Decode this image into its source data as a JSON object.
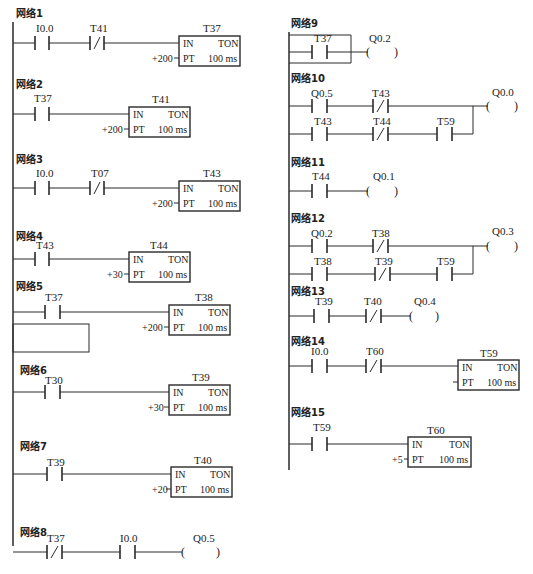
{
  "diagram": {
    "type": "PLC ladder diagram",
    "networks": [
      {
        "id": "n1",
        "label": "网络1",
        "rungs": [
          {
            "contacts": [
              {
                "name": "I0.0",
                "type": "NO"
              },
              {
                "name": "T41",
                "type": "NC"
              }
            ],
            "output": {
              "kind": "timer",
              "name": "T37",
              "type": "TON",
              "in": "IN",
              "pt_label": "PT",
              "preset": "+200",
              "base": "100 ms"
            }
          }
        ]
      },
      {
        "id": "n2",
        "label": "网络2",
        "rungs": [
          {
            "contacts": [
              {
                "name": "T37",
                "type": "NO"
              }
            ],
            "output": {
              "kind": "timer",
              "name": "T41",
              "type": "TON",
              "in": "IN",
              "pt_label": "PT",
              "preset": "+200",
              "base": "100 ms"
            }
          }
        ]
      },
      {
        "id": "n3",
        "label": "网络3",
        "rungs": [
          {
            "contacts": [
              {
                "name": "I0.0",
                "type": "NO"
              },
              {
                "name": "T07",
                "type": "NC"
              }
            ],
            "output": {
              "kind": "timer",
              "name": "T43",
              "type": "TON",
              "in": "IN",
              "pt_label": "PT",
              "preset": "+200",
              "base": "100 ms"
            }
          }
        ]
      },
      {
        "id": "n4",
        "label": "网络4",
        "rungs": [
          {
            "contacts": [
              {
                "name": "T43",
                "type": "NO"
              }
            ],
            "output": {
              "kind": "timer",
              "name": "T44",
              "type": "TON",
              "in": "IN",
              "pt_label": "PT",
              "preset": "+30",
              "base": "100 ms"
            }
          }
        ]
      },
      {
        "id": "n5",
        "label": "网络5",
        "rungs": [
          {
            "contacts": [
              {
                "name": "T37",
                "type": "NO"
              }
            ],
            "output": {
              "kind": "timer",
              "name": "T38",
              "type": "TON",
              "in": "IN",
              "pt_label": "PT",
              "preset": "+200",
              "base": "100 ms"
            }
          }
        ],
        "note": "empty parallel branch below contact"
      },
      {
        "id": "n6",
        "label": "网络6",
        "rungs": [
          {
            "contacts": [
              {
                "name": "T30",
                "type": "NO"
              }
            ],
            "output": {
              "kind": "timer",
              "name": "T39",
              "type": "TON",
              "in": "IN",
              "pt_label": "PT",
              "preset": "+30",
              "base": "100 ms"
            }
          }
        ]
      },
      {
        "id": "n7",
        "label": "网络7",
        "rungs": [
          {
            "contacts": [
              {
                "name": "T39",
                "type": "NO"
              }
            ],
            "output": {
              "kind": "timer",
              "name": "T40",
              "type": "TON",
              "in": "IN",
              "pt_label": "PT",
              "preset": "+20",
              "base": "100 ms"
            }
          }
        ]
      },
      {
        "id": "n8",
        "label": "网络8",
        "rungs": [
          {
            "contacts": [
              {
                "name": "T37",
                "type": "NC"
              },
              {
                "name": "I0.0",
                "type": "NO"
              }
            ],
            "output": {
              "kind": "coil",
              "name": "Q0.5"
            }
          }
        ]
      },
      {
        "id": "n9",
        "label": "网络9",
        "rungs": [
          {
            "contacts": [
              {
                "name": "T37",
                "type": "NO"
              }
            ],
            "output": {
              "kind": "coil",
              "name": "Q0.2"
            }
          }
        ],
        "note": "empty parallel branch around contact"
      },
      {
        "id": "n10",
        "label": "网络10",
        "rungs": [
          {
            "contacts": [
              {
                "name": "Q0.5",
                "type": "NO"
              },
              {
                "name": "T43",
                "type": "NC"
              }
            ],
            "output": {
              "kind": "coil",
              "name": "Q0.0"
            }
          },
          {
            "contacts": [
              {
                "name": "T43",
                "type": "NO"
              },
              {
                "name": "T44",
                "type": "NC"
              },
              {
                "name": "T59",
                "type": "NO"
              }
            ],
            "parallel": true
          }
        ]
      },
      {
        "id": "n11",
        "label": "网络11",
        "rungs": [
          {
            "contacts": [
              {
                "name": "T44",
                "type": "NO"
              }
            ],
            "output": {
              "kind": "coil",
              "name": "Q0.1"
            }
          }
        ]
      },
      {
        "id": "n12",
        "label": "网络12",
        "rungs": [
          {
            "contacts": [
              {
                "name": "Q0.2",
                "type": "NO"
              },
              {
                "name": "T38",
                "type": "NC"
              }
            ],
            "output": {
              "kind": "coil",
              "name": "Q0.3"
            }
          },
          {
            "contacts": [
              {
                "name": "T38",
                "type": "NO"
              },
              {
                "name": "T39",
                "type": "NC"
              },
              {
                "name": "T59",
                "type": "NO"
              }
            ],
            "parallel": true
          }
        ]
      },
      {
        "id": "n13",
        "label": "网络13",
        "rungs": [
          {
            "contacts": [
              {
                "name": "T39",
                "type": "NO"
              },
              {
                "name": "T40",
                "type": "NC"
              }
            ],
            "output": {
              "kind": "coil",
              "name": "Q0.4"
            }
          }
        ]
      },
      {
        "id": "n14",
        "label": "网络14",
        "rungs": [
          {
            "contacts": [
              {
                "name": "I0.0",
                "type": "NO"
              },
              {
                "name": "T60",
                "type": "NC"
              }
            ],
            "output": {
              "kind": "timer",
              "name": "T59",
              "type": "TON",
              "in": "IN",
              "pt_label": "PT",
              "preset": "",
              "base": "100 ms"
            }
          }
        ]
      },
      {
        "id": "n15",
        "label": "网络15",
        "rungs": [
          {
            "contacts": [
              {
                "name": "T59",
                "type": "NO"
              }
            ],
            "output": {
              "kind": "timer",
              "name": "T60",
              "type": "TON",
              "in": "IN",
              "pt_label": "PT",
              "preset": "+5",
              "base": "100 ms"
            }
          }
        ]
      }
    ]
  },
  "text": {
    "n1": {
      "label": "网络1",
      "c1": "I0.0",
      "c2": "T41",
      "timer": "T37",
      "in": "IN",
      "ton": "TON",
      "pt": "PT",
      "preset": "+200",
      "base": "100 ms"
    },
    "n2": {
      "label": "网络2",
      "c1": "T37",
      "timer": "T41",
      "in": "IN",
      "ton": "TON",
      "pt": "PT",
      "preset": "+200",
      "base": "100 ms"
    },
    "n3": {
      "label": "网络3",
      "c1": "I0.0",
      "c2": "T07",
      "timer": "T43",
      "in": "IN",
      "ton": "TON",
      "pt": "PT",
      "preset": "+200",
      "base": "100 ms"
    },
    "n4": {
      "label": "网络4",
      "c1": "T43",
      "timer": "T44",
      "in": "IN",
      "ton": "TON",
      "pt": "PT",
      "preset": "+30",
      "base": "100 ms"
    },
    "n5": {
      "label": "网络5",
      "c1": "T37",
      "timer": "T38",
      "in": "IN",
      "ton": "TON",
      "pt": "PT",
      "preset": "+200",
      "base": "100 ms"
    },
    "n6": {
      "label": "网络6",
      "c1": "T30",
      "timer": "T39",
      "in": "IN",
      "ton": "TON",
      "pt": "PT",
      "preset": "+30",
      "base": "100 ms"
    },
    "n7": {
      "label": "网络7",
      "c1": "T39",
      "timer": "T40",
      "in": "IN",
      "ton": "TON",
      "pt": "PT",
      "preset": "+20",
      "base": "100 ms"
    },
    "n8": {
      "label": "网络8",
      "c1": "T37",
      "c2": "I0.0",
      "coil": "Q0.5"
    },
    "n9": {
      "label": "网络9",
      "c1": "T37",
      "coil": "Q0.2"
    },
    "n10": {
      "label": "网络10",
      "c1": "Q0.5",
      "c2": "T43",
      "coil": "Q0.0",
      "b1": "T43",
      "b2": "T44",
      "b3": "T59"
    },
    "n11": {
      "label": "网络11",
      "c1": "T44",
      "coil": "Q0.1"
    },
    "n12": {
      "label": "网络12",
      "c1": "Q0.2",
      "c2": "T38",
      "coil": "Q0.3",
      "b1": "T38",
      "b2": "T39",
      "b3": "T59"
    },
    "n13": {
      "label": "网络13",
      "c1": "T39",
      "c2": "T40",
      "coil": "Q0.4"
    },
    "n14": {
      "label": "网络14",
      "c1": "I0.0",
      "c2": "T60",
      "timer": "T59",
      "in": "IN",
      "ton": "TON",
      "pt": "PT",
      "base": "100 ms"
    },
    "n15": {
      "label": "网络15",
      "c1": "T59",
      "timer": "T60",
      "in": "IN",
      "ton": "TON",
      "pt": "PT",
      "preset": "+5",
      "base": "100 ms"
    },
    "coil_open": "(",
    "coil_close": ")"
  }
}
